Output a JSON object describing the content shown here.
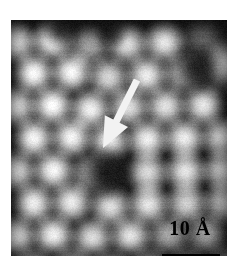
{
  "figure": {
    "kind": "stm-micrograph",
    "width": 243,
    "height": 267,
    "background_color": "#ffffff",
    "panel": {
      "x": 11,
      "y": 20,
      "width": 216,
      "height": 236,
      "border_color": "#000000"
    }
  },
  "scalebar": {
    "label": "10 Å",
    "length_value": 10,
    "length_unit": "Å",
    "bar_color": "#000000",
    "text_color": "#000000",
    "bar_x": 151,
    "bar_y": 234,
    "bar_width": 58,
    "bar_height": 5,
    "label_x": 141,
    "label_y": 196
  },
  "annotations": [
    {
      "name": "defect-arrow",
      "type": "arrow",
      "color": "#f2f2f2",
      "tail_x": 126,
      "tail_y": 60,
      "head_x": 92,
      "head_y": 128,
      "shaft_width": 7,
      "head_width": 26,
      "head_length": 30,
      "points_to": "dark-vacancy-defect"
    }
  ],
  "chart_data": {
    "type": "heatmap",
    "title": "",
    "xlabel": "",
    "ylabel": "",
    "colormap": "grayscale",
    "value_range": [
      0,
      255
    ],
    "lattice": {
      "type": "hexagonal",
      "spacing_px": 37.5,
      "row_offset_px": 18.7,
      "row_height_px": 32.5,
      "rotation_deg": -4,
      "blob_radius_px": 15,
      "bright_level": 232,
      "dark_level": 14
    },
    "defects": [
      {
        "name": "vacancy",
        "x": 96,
        "y": 152,
        "radius": 23,
        "depth": 1.0
      },
      {
        "name": "dark-patch-upper-right",
        "x": 186,
        "y": 48,
        "radius": 22,
        "depth": 0.92
      },
      {
        "name": "dark-patch-top",
        "x": 50,
        "y": 8,
        "radius": 17,
        "depth": 0.85
      },
      {
        "name": "dark-patch-top-mid",
        "x": 100,
        "y": 12,
        "radius": 14,
        "depth": 0.7
      }
    ],
    "atom_sites": [
      {
        "x": 4,
        "y": 22,
        "b": 0.88
      },
      {
        "x": 41,
        "y": 20,
        "b": 0.92
      },
      {
        "x": 78,
        "y": 26,
        "b": 0.55
      },
      {
        "x": 116,
        "y": 24,
        "b": 0.8
      },
      {
        "x": 153,
        "y": 22,
        "b": 0.86
      },
      {
        "x": 191,
        "y": 20,
        "b": 0.3
      },
      {
        "x": 214,
        "y": 40,
        "b": 0.6
      },
      {
        "x": 22,
        "y": 53,
        "b": 0.95
      },
      {
        "x": 60,
        "y": 52,
        "b": 0.93
      },
      {
        "x": 97,
        "y": 57,
        "b": 0.78
      },
      {
        "x": 135,
        "y": 55,
        "b": 0.88
      },
      {
        "x": 172,
        "y": 53,
        "b": 0.72
      },
      {
        "x": 209,
        "y": 52,
        "b": 0.35
      },
      {
        "x": 4,
        "y": 86,
        "b": 0.9
      },
      {
        "x": 41,
        "y": 85,
        "b": 0.96
      },
      {
        "x": 79,
        "y": 89,
        "b": 0.9
      },
      {
        "x": 117,
        "y": 87,
        "b": 0.82
      },
      {
        "x": 154,
        "y": 86,
        "b": 0.84
      },
      {
        "x": 192,
        "y": 85,
        "b": 0.88
      },
      {
        "x": 22,
        "y": 118,
        "b": 0.94
      },
      {
        "x": 60,
        "y": 117,
        "b": 0.92
      },
      {
        "x": 98,
        "y": 121,
        "b": 0.88
      },
      {
        "x": 136,
        "y": 119,
        "b": 0.9
      },
      {
        "x": 173,
        "y": 118,
        "b": 0.9
      },
      {
        "x": 211,
        "y": 117,
        "b": 0.86
      },
      {
        "x": 4,
        "y": 151,
        "b": 0.9
      },
      {
        "x": 42,
        "y": 150,
        "b": 0.94
      },
      {
        "x": 80,
        "y": 153,
        "b": 0.66
      },
      {
        "x": 136,
        "y": 152,
        "b": 0.82
      },
      {
        "x": 174,
        "y": 151,
        "b": 0.88
      },
      {
        "x": 212,
        "y": 150,
        "b": 0.84
      },
      {
        "x": 22,
        "y": 183,
        "b": 0.92
      },
      {
        "x": 60,
        "y": 182,
        "b": 0.9
      },
      {
        "x": 99,
        "y": 186,
        "b": 0.84
      },
      {
        "x": 137,
        "y": 184,
        "b": 0.88
      },
      {
        "x": 175,
        "y": 183,
        "b": 0.8
      },
      {
        "x": 213,
        "y": 182,
        "b": 0.78
      },
      {
        "x": 4,
        "y": 216,
        "b": 0.9
      },
      {
        "x": 42,
        "y": 215,
        "b": 0.94
      },
      {
        "x": 81,
        "y": 218,
        "b": 0.86
      },
      {
        "x": 119,
        "y": 216,
        "b": 0.88
      },
      {
        "x": 157,
        "y": 215,
        "b": 0.62
      },
      {
        "x": 195,
        "y": 214,
        "b": 0.58
      },
      {
        "x": 22,
        "y": 248,
        "b": 0.88
      },
      {
        "x": 61,
        "y": 247,
        "b": 0.9
      },
      {
        "x": 100,
        "y": 250,
        "b": 0.84
      },
      {
        "x": 138,
        "y": 248,
        "b": 0.8
      },
      {
        "x": 176,
        "y": 247,
        "b": 0.6
      },
      {
        "x": 214,
        "y": 246,
        "b": 0.55
      }
    ]
  }
}
